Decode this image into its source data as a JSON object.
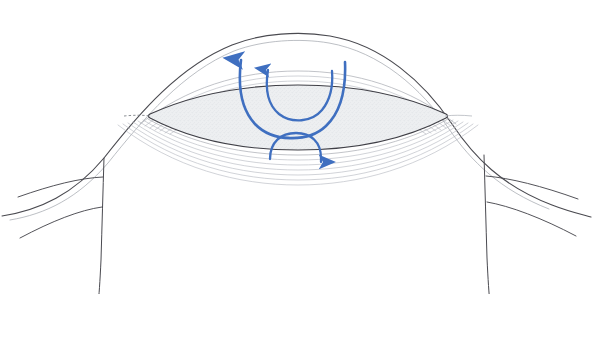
{
  "page": {
    "width": 593,
    "height": 354,
    "background": "#ffffff"
  },
  "caption": {
    "text": "入り、そのまま前後に前後し、後部は後部子宮と壁に縫合する。",
    "note": "top caption line is cropped by the image edge; only the lowest pixels of the glyphs are visible",
    "color": "#5b5b60"
  },
  "figure": {
    "colors": {
      "outline_dark": "#3c3c42",
      "contour_light": "#b9bcc2",
      "contour_mid": "#9a9da4",
      "fill_stipple": "#ebedf0",
      "arrow_blue": "#3f6fc0",
      "arrow_blue_dark": "#2e5ead",
      "background": "#ffffff"
    },
    "elements": [
      {
        "name": "outer-dome-curve",
        "kind": "line",
        "description": "large arching boundary sweeping from lower-left up over the centre and down to lower-right"
      },
      {
        "name": "central-lens-body",
        "kind": "filled-shape",
        "description": "horizontal lens / leaf shaped body with stippled grey fill and dark outline"
      },
      {
        "name": "contour-lines-upper",
        "kind": "line-family",
        "count": 7,
        "description": "nested contour lines following the upper surface of the lens body"
      },
      {
        "name": "contour-lines-lower",
        "kind": "line-family",
        "count": 7,
        "description": "nested contour lines fanning below the lens body"
      },
      {
        "name": "left-lateral-wall",
        "kind": "line",
        "description": "vertical descending boundary at the left with two curved branches sweeping left"
      },
      {
        "name": "right-lateral-wall",
        "kind": "line",
        "description": "vertical descending boundary at the right with two curved branches sweeping right"
      },
      {
        "name": "arrow-large-upper-u",
        "kind": "arrow",
        "direction": "up-left",
        "description": "large U shaped blue arc terminating in an upward arrowhead on the left"
      },
      {
        "name": "arrow-small-upper-u",
        "kind": "arrow",
        "direction": "up",
        "description": "smaller U shaped blue arc terminating in an upward arrowhead"
      },
      {
        "name": "arrow-lower-arch",
        "kind": "arrow",
        "direction": "down-right",
        "description": "inverted U blue arch terminating in a downward arrowhead on the right"
      }
    ],
    "arrow_count": 3
  }
}
